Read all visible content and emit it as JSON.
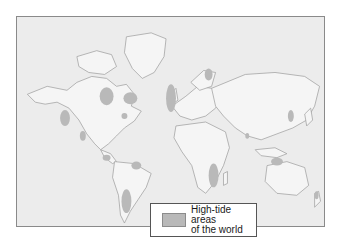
{
  "map": {
    "type": "world-map",
    "projection": "mercator",
    "colors": {
      "ocean": "#ececec",
      "land": "#f4f4f4",
      "coast": "#9a9a9a",
      "high_tide": "#b9b9b9",
      "frame": "#8a8a8a"
    },
    "highlighted_regions": [
      "Alaska (Cook Inlet)",
      "Hudson Bay",
      "Labrador / Ungava",
      "Bay of Fundy",
      "Gulf of California",
      "Panama (Pacific coast)",
      "Amazon mouth (Brazil)",
      "Patagonia (Argentina)",
      "British Isles / North Sea",
      "Northern Russia (White Sea)",
      "Mozambique / Madagascar channel",
      "Gulf of Khambhat (India)",
      "Korea / Yellow Sea",
      "Northwest Australia",
      "New Zealand"
    ]
  },
  "legend": {
    "label_line1": "High-tide areas",
    "label_line2": "of the world",
    "swatch_color": "#b9b9b9"
  }
}
